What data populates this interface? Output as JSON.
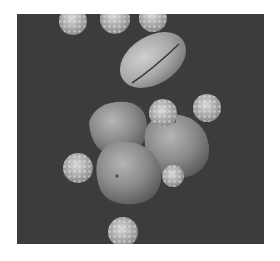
{
  "image": {
    "subject": "scanning electron micrograph of pollen grains",
    "background_color": "#3c3c3c",
    "objects": [
      {
        "type": "elongated-pollen-grain",
        "count": 1
      },
      {
        "type": "smooth-round-pollen-grain",
        "count": 3
      },
      {
        "type": "spiky-pollen-grain",
        "count": 8
      }
    ]
  }
}
